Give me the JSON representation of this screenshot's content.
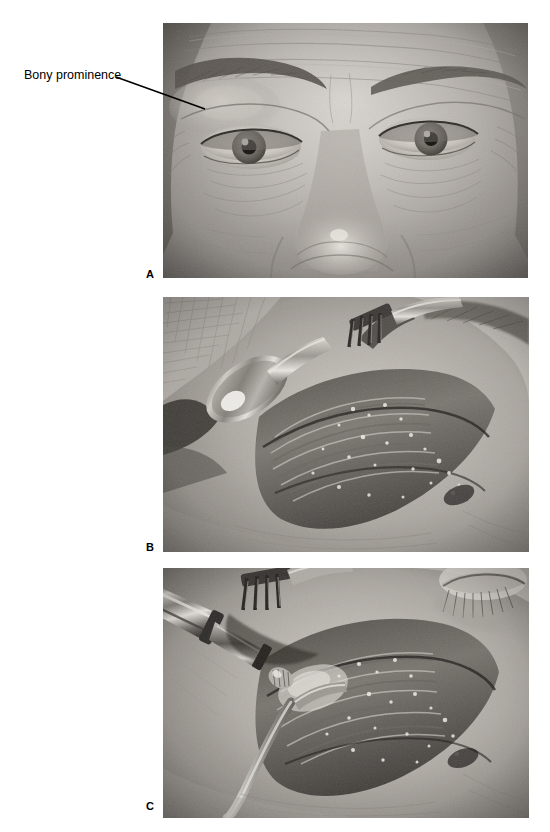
{
  "figure": {
    "background_color": "#ffffff",
    "width": 550,
    "height": 832,
    "annotation": {
      "label": "Bony prominence",
      "leader_line": {
        "from_x": 116,
        "from_y": 77,
        "to_x": 205,
        "to_y": 109,
        "color": "#000000"
      }
    },
    "panels": [
      {
        "id": "A",
        "label": "A",
        "caption_position": "bottom-left",
        "description": "Grayscale frontal clinical photograph of an older woman's upper face showing forehead, both eyebrows, both eyes and the nose, with prominent forehead and periorbital wrinkles. A leader line labeled Bony prominence points to the lateral supraorbital rim above the patient's right eye.",
        "modality": "clinical photograph",
        "color_mode": "grayscale",
        "x": 163,
        "y": 23,
        "width": 365,
        "height": 255
      },
      {
        "id": "B",
        "label": "B",
        "caption_position": "bottom-left",
        "description": "Intraoperative grayscale photograph of an upper eyelid / brow incision. A spoon-shaped malleable retractor on the left and a multi-prong skin hook at upper right retract the wound edges, exposing glistening orbicularis muscle and subcutaneous tissue over the supraorbital rim.",
        "modality": "intraoperative photograph",
        "color_mode": "grayscale",
        "instruments": [
          "spoon retractor",
          "multi-prong skin hook"
        ],
        "x": 163,
        "y": 297,
        "width": 366,
        "height": 255
      },
      {
        "id": "C",
        "label": "C",
        "caption_position": "bottom-left",
        "description": "Intraoperative grayscale photograph showing a powered rotary burr handpiece entering the wound from the upper left to contour the bony prominence, with a multi-prong skin hook above and a curved retractor below holding the incision open.",
        "modality": "intraoperative photograph",
        "color_mode": "grayscale",
        "instruments": [
          "powered burr handpiece",
          "multi-prong skin hook",
          "curved retractor"
        ],
        "x": 163,
        "y": 568,
        "width": 366,
        "height": 250
      }
    ]
  }
}
